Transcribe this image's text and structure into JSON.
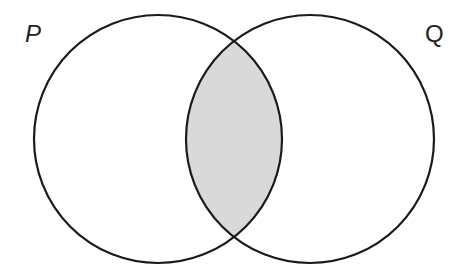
{
  "diagram": {
    "type": "venn",
    "sets": [
      {
        "name": "P",
        "label": "P",
        "cx": 158,
        "cy": 139,
        "r": 124
      },
      {
        "name": "Q",
        "label": "Q",
        "cx": 310,
        "cy": 139,
        "r": 124
      }
    ],
    "shaded_region": "P ∩ Q",
    "colors": {
      "stroke": "#1a1a1a",
      "shade": "#d9d9d9",
      "background": "#ffffff"
    }
  }
}
